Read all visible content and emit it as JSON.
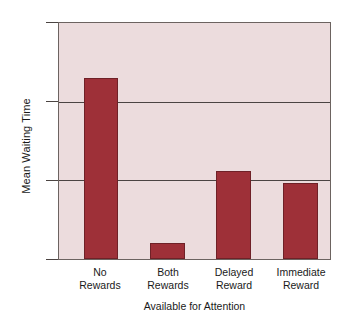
{
  "chart_data": {
    "type": "bar",
    "title": "",
    "categories": [
      "No\nRewards",
      "Both\nRewards",
      "Delayed\nReward",
      "Immediate\nReward"
    ],
    "category_lines": [
      [
        "No",
        "Rewards"
      ],
      [
        "Both",
        "Rewards"
      ],
      [
        "Delayed",
        "Reward"
      ],
      [
        "Immediate",
        "Reward"
      ]
    ],
    "values": [
      11.5,
      1.0,
      5.6,
      4.85
    ],
    "xlabel": "Available for Attention",
    "ylabel": "Mean Waiting Time",
    "ylim": [
      0,
      15
    ],
    "yticks": [
      0,
      5,
      10,
      15
    ],
    "ytick_labels": [
      "0",
      "5",
      "10",
      "15"
    ],
    "grid": "horizontal",
    "legend": "none",
    "bar_color": "#9e3038",
    "bar_edge_color": "#6f2127",
    "plot_background": "#ecdcdd",
    "axis_color": "#6c6360",
    "figure_background": "#ffffff"
  }
}
